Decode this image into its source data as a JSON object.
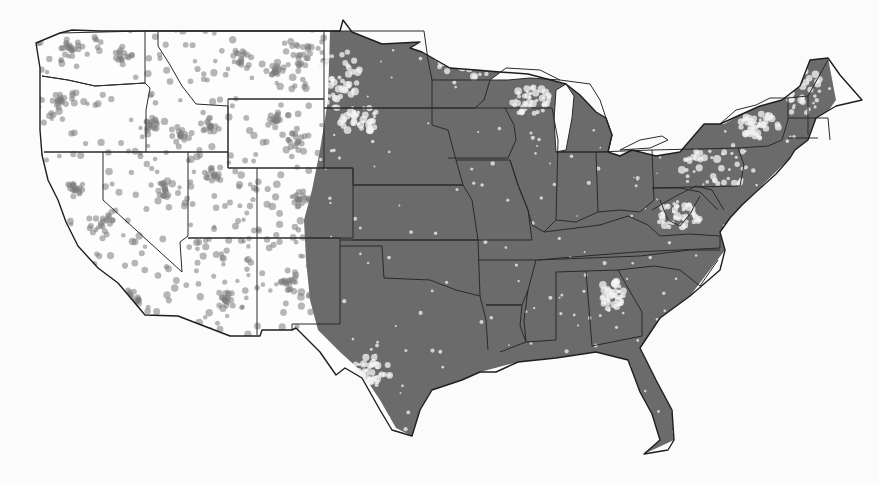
{
  "map": {
    "subject": "Contiguous United States dot-density map",
    "style": "grayscale",
    "colors": {
      "background": "#fbfbfb",
      "dense_fill": "#6b6b6b",
      "dot": "#7c7c7c",
      "border": "#2a2a2a"
    },
    "outline": "M 60,33 L 36,43 L 40,68 L 40,130 L 42,155 L 48,180 L 58,200 L 66,222 L 78,246 L 98,268 L 118,283 L 145,315 L 178,316 L 230,336 L 260,336 L 262,330 L 292,330 L 296,328 L 320,352 L 336,375 L 345,368 L 362,378 L 380,410 L 392,430 L 412,436 L 420,410 L 432,390 L 462,380 L 480,372 L 496,372 L 518,362 L 556,358 L 596,352 L 628,360 L 640,392 L 652,414 L 660,440 L 644,454 L 668,450 L 674,440 L 672,410 L 656,380 L 640,348 L 660,318 L 690,296 L 720,270 L 725,250 L 720,232 L 730,218 L 742,205 L 756,192 L 776,174 L 790,158 L 795,150 L 808,140 L 816,118 L 836,106 L 862,100 L 840,75 L 828,58 L 810,60 L 800,86 L 782,100 L 760,106 L 720,124 L 704,124 L 680,152 L 656,156 L 632,150 L 620,156 L 608,152 L 612,135 L 606,118 L 596,112 L 580,95 L 566,84 L 528,74 L 500,72 L 476,70 L 450,68 L 422,52 L 410,48 L 420,42 L 382,44 L 352,32 L 343,20 L 340,31 L 100,31 L 72,30 Z",
    "states": [
      {
        "name": "washington",
        "d": "M 60,33 L 145,31 L 145,83 L 95,86 L 68,80 L 42,76"
      },
      {
        "name": "oregon-idaho",
        "d": "M 42,76 L 68,80 L 95,86 L 145,83 L 150,88 L 146,110 L 146,152 L 44,152"
      },
      {
        "name": "idaho-montana",
        "d": "M 145,31 L 158,31 L 158,46 L 170,65 L 182,86 L 196,104 L 228,106 L 228,152 L 146,152"
      },
      {
        "name": "montana",
        "d": "M 158,31 L 324,31 L 324,99 L 228,99"
      },
      {
        "name": "wyoming",
        "d": "M 228,99 L 324,99 L 324,168 L 228,168 Z"
      },
      {
        "name": "california-nevada",
        "d": "M 44,152 L 103,152 L 103,200 L 182,272"
      },
      {
        "name": "nevada-utah",
        "d": "M 103,152 L 188,152 L 188,236 L 180,242 L 182,272"
      },
      {
        "name": "utah",
        "d": "M 188,152 L 228,152 L 228,168 L 257,168 L 257,238 L 188,238"
      },
      {
        "name": "colorado",
        "d": "M 257,168 L 353,168 L 353,238 L 257,238"
      },
      {
        "name": "arizona",
        "d": "M 188,238 L 257,238 L 257,335"
      },
      {
        "name": "new-mexico",
        "d": "M 257,238 L 340,238 L 340,324 L 292,324 L 292,330"
      },
      {
        "name": "dakotas",
        "d": "M 324,31 L 424,31 L 428,60 L 432,80 L 432,108 L 324,108"
      },
      {
        "name": "nebraska",
        "d": "M 324,108 L 432,108 L 432,125 L 448,130 L 456,160 L 463,185 L 353,185 L 353,168 L 324,168"
      },
      {
        "name": "kansas",
        "d": "M 353,185 L 463,185 L 472,200 L 478,240 L 353,240"
      },
      {
        "name": "oklahoma",
        "d": "M 340,240 L 478,240 L 480,296 L 456,290 L 430,280 L 384,278 L 382,246 L 340,246"
      },
      {
        "name": "texas-east",
        "d": "M 480,296 L 486,320 L 488,350"
      },
      {
        "name": "minnesota",
        "d": "M 432,80 L 490,80 L 484,100 L 475,108 L 432,108"
      },
      {
        "name": "wisconsin-iowa",
        "d": "M 432,108 L 505,108 L 514,125 L 516,140 L 508,158 L 448,158"
      },
      {
        "name": "missouri",
        "d": "M 456,160 L 510,160 L 518,185 L 528,210 L 532,240 L 478,240"
      },
      {
        "name": "arkansas",
        "d": "M 478,260 L 536,260 L 528,290 L 522,305 L 486,305"
      },
      {
        "name": "illinois",
        "d": "M 505,108 L 552,108 L 558,140 L 556,220 L 544,232 L 532,225 L 528,210 L 518,185 L 510,160"
      },
      {
        "name": "michigan-lp",
        "d": "M 560,80 L 590,84 L 600,100 L 606,118 L 612,135 L 608,152 L 556,152"
      },
      {
        "name": "indiana-ohio",
        "d": "M 556,152 L 596,152 L 598,212 L 576,222 L 556,220"
      },
      {
        "name": "ohio",
        "d": "M 596,152 L 652,150 L 654,200 L 640,212 L 620,210 L 598,212"
      },
      {
        "name": "kentucky-tennessee",
        "d": "M 544,232 L 600,225 L 628,216 L 648,225 L 660,236 L 690,234 L 720,236 L 720,248 L 636,252 L 560,258 L 538,260"
      },
      {
        "name": "tennessee-south",
        "d": "M 536,260 L 640,256 L 690,250 L 720,250"
      },
      {
        "name": "mississippi-alabama",
        "d": "M 528,290 L 524,320 L 526,342 L 556,340 L 556,272 L 586,271 L 592,346"
      },
      {
        "name": "alabama-georgia",
        "d": "M 586,271 L 618,270 L 628,288 L 642,312 L 642,336 L 592,346"
      },
      {
        "name": "carolinas",
        "d": "M 618,270 L 654,266 L 680,270 L 700,286 L 718,260"
      },
      {
        "name": "louisiana",
        "d": "M 486,305 L 522,305 L 520,326 L 526,342 L 500,352"
      },
      {
        "name": "virginia",
        "d": "M 652,210 L 676,196 L 696,186 L 712,190 L 724,210"
      },
      {
        "name": "pennsylvania",
        "d": "M 652,150 L 738,148 L 744,165 L 740,186 L 652,188"
      },
      {
        "name": "new-york",
        "d": "M 738,148 L 768,146 L 782,140 L 788,120 L 788,98 L 770,98 L 756,105 L 736,110 L 720,124"
      },
      {
        "name": "new-england",
        "d": "M 788,98 L 808,96 L 828,60 M 788,118 L 828,118 L 830,140 M 788,138 L 818,138 M 808,96 L 808,135"
      },
      {
        "name": "wv-md",
        "d": "M 652,188 L 680,188 L 700,192 L 718,210 M 660,200 L 668,220 L 680,226 L 690,214 L 700,196"
      }
    ],
    "lakes": [
      {
        "name": "lake-michigan",
        "d": "M 556,90 L 566,84 L 574,96 L 572,118 L 566,150 L 556,152 L 554,120 Z"
      },
      {
        "name": "lake-superior",
        "d": "M 490,80 L 506,68 L 540,70 L 560,80 L 530,78 L 508,80 Z"
      },
      {
        "name": "lake-erie",
        "d": "M 620,150 L 640,140 L 662,136 L 668,140 L 650,148 Z"
      }
    ],
    "dense_region": "M 330,31 L 424,31 L 470,66 L 560,80 L 600,98 L 612,135 L 652,140 L 700,124 L 724,124 L 760,104 L 790,92 L 806,60 L 828,58 L 836,100 L 808,140 L 790,158 L 742,205 L 720,232 L 725,250 L 690,296 L 640,348 L 656,380 L 672,410 L 674,440 L 644,454 L 652,414 L 640,392 L 628,360 L 596,352 L 556,358 L 518,362 L 480,372 L 462,380 L 432,390 L 420,410 L 412,436 L 396,428 L 380,400 L 360,370 L 340,352 L 318,330 L 310,300 L 306,260 L 304,220 L 312,190 L 320,150 L 328,100 Z",
    "light_patches": [
      {
        "cx": 340,
        "cy": 80,
        "rx": 22,
        "ry": 30
      },
      {
        "cx": 360,
        "cy": 120,
        "rx": 20,
        "ry": 14
      },
      {
        "cx": 720,
        "cy": 165,
        "rx": 40,
        "ry": 22
      },
      {
        "cx": 800,
        "cy": 90,
        "rx": 22,
        "ry": 24
      },
      {
        "cx": 760,
        "cy": 125,
        "rx": 20,
        "ry": 14
      },
      {
        "cx": 680,
        "cy": 215,
        "rx": 24,
        "ry": 14
      },
      {
        "cx": 612,
        "cy": 295,
        "rx": 12,
        "ry": 16
      },
      {
        "cx": 465,
        "cy": 60,
        "rx": 34,
        "ry": 18
      },
      {
        "cx": 530,
        "cy": 100,
        "rx": 20,
        "ry": 14
      },
      {
        "cx": 372,
        "cy": 370,
        "rx": 20,
        "ry": 14
      }
    ],
    "dot_clusters": [
      {
        "cx": 70,
        "cy": 48,
        "r": 10
      },
      {
        "cx": 120,
        "cy": 55,
        "r": 12
      },
      {
        "cx": 60,
        "cy": 100,
        "r": 8
      },
      {
        "cx": 150,
        "cy": 125,
        "r": 8
      },
      {
        "cx": 180,
        "cy": 135,
        "r": 12
      },
      {
        "cx": 210,
        "cy": 125,
        "r": 10
      },
      {
        "cx": 240,
        "cy": 60,
        "r": 12
      },
      {
        "cx": 275,
        "cy": 70,
        "r": 10
      },
      {
        "cx": 300,
        "cy": 55,
        "r": 12
      },
      {
        "cx": 275,
        "cy": 120,
        "r": 10
      },
      {
        "cx": 300,
        "cy": 140,
        "r": 12
      },
      {
        "cx": 90,
        "cy": 270,
        "r": 8
      },
      {
        "cx": 100,
        "cy": 225,
        "r": 14
      },
      {
        "cx": 75,
        "cy": 190,
        "r": 10
      },
      {
        "cx": 130,
        "cy": 300,
        "r": 10
      },
      {
        "cx": 215,
        "cy": 175,
        "r": 10
      },
      {
        "cx": 225,
        "cy": 300,
        "r": 10
      },
      {
        "cx": 290,
        "cy": 280,
        "r": 12
      },
      {
        "cx": 300,
        "cy": 200,
        "r": 10
      },
      {
        "cx": 165,
        "cy": 190,
        "r": 8
      }
    ]
  }
}
